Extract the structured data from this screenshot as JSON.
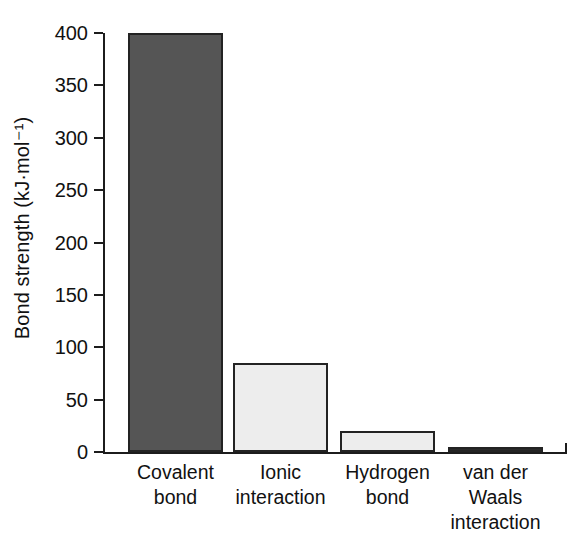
{
  "chart_data": {
    "type": "bar",
    "title": "",
    "xlabel": "",
    "ylabel": "Bond strength (kJ·mol⁻¹)",
    "categories": [
      "Covalent bond",
      "Ionic interaction",
      "Hydrogen bond",
      "van der Waals interaction"
    ],
    "category_lines": [
      [
        "Covalent",
        "bond"
      ],
      [
        "Ionic",
        "interaction"
      ],
      [
        "Hydrogen",
        "bond"
      ],
      [
        "van der",
        "Waals",
        "interaction"
      ]
    ],
    "values": [
      400,
      85,
      20,
      3
    ],
    "ylim": [
      0,
      400
    ],
    "yticks": [
      0,
      50,
      100,
      150,
      200,
      250,
      300,
      350,
      400
    ],
    "ytick_labels": [
      "0",
      "50",
      "100",
      "150",
      "200",
      "250",
      "300",
      "350",
      "400"
    ],
    "grid": false,
    "legend": "none",
    "bar_colors": [
      "#555555",
      "#ededed",
      "#ededed",
      "#2b2b2b"
    ],
    "bar_edge_color": "#232323"
  },
  "axis": {
    "y_title": "Bond strength (kJ·mol⁻¹)",
    "tick_0": "0",
    "tick_50": "50",
    "tick_100": "100",
    "tick_150": "150",
    "tick_200": "200",
    "tick_250": "250",
    "tick_300": "300",
    "tick_350": "350",
    "tick_400": "400"
  }
}
